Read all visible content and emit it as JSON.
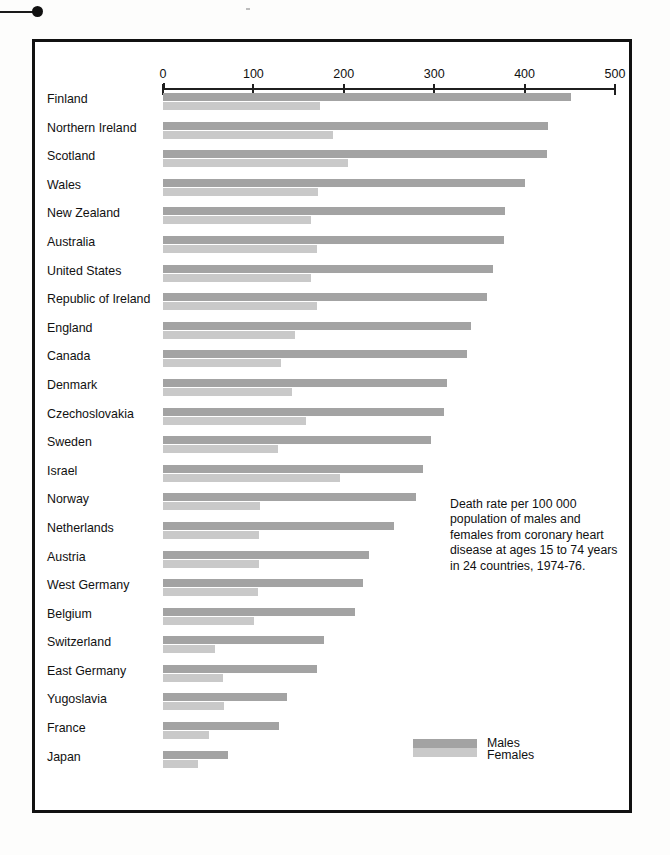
{
  "figure": {
    "caption": "Death rate per 100 000 population of males and females from coronary heart disease at ages 15 to 74 years in 24 countries, 1974-76."
  },
  "legend": {
    "male_label": "Males",
    "female_label": "Females",
    "male_color": "#a3a3a3",
    "female_color": "#c9c9c9"
  },
  "chart_data": {
    "type": "bar",
    "orientation": "horizontal",
    "title": "Death rate per 100 000 population of males and females from coronary heart disease at ages 15 to 74 years in 24 countries, 1974-76.",
    "xlabel": "",
    "ylabel": "",
    "xlim": [
      0,
      500
    ],
    "xticks": [
      0,
      100,
      200,
      300,
      400,
      500
    ],
    "xtick_labels": [
      "0",
      "100",
      "200",
      "300",
      "400",
      "500"
    ],
    "grid": false,
    "legend_position": "bottom-right",
    "categories": [
      "Finland",
      "Northern Ireland",
      "Scotland",
      "Wales",
      "New Zealand",
      "Australia",
      "United States",
      "Republic of Ireland",
      "England",
      "Canada",
      "Denmark",
      "Czechoslovakia",
      "Sweden",
      "Israel",
      "Norway",
      "Netherlands",
      "Austria",
      "West Germany",
      "Belgium",
      "Switzerland",
      "East Germany",
      "Yugoslavia",
      "France",
      "Japan"
    ],
    "series": [
      {
        "name": "Males",
        "color": "#a3a3a3",
        "values": [
          451,
          426,
          425,
          400,
          378,
          377,
          365,
          358,
          341,
          336,
          314,
          311,
          296,
          288,
          280,
          255,
          228,
          221,
          212,
          178,
          170,
          137,
          128,
          72
        ]
      },
      {
        "name": "Females",
        "color": "#c9c9c9",
        "values": [
          174,
          188,
          205,
          172,
          164,
          170,
          164,
          170,
          146,
          130,
          143,
          158,
          127,
          196,
          107,
          106,
          106,
          105,
          101,
          58,
          66,
          67,
          51,
          39
        ]
      }
    ]
  }
}
